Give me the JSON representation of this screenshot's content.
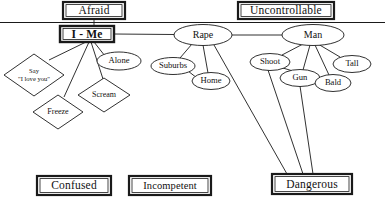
{
  "diagram": {
    "type": "concept-map",
    "background_color": "#ffffff",
    "line_color": "#1a1a1a",
    "text_color": "#111111",
    "divider": {
      "name": "horizontal-divider",
      "y": 22,
      "x1": 0,
      "x2": 385
    },
    "boxes": [
      {
        "id": "afraid",
        "label": "Afraid",
        "x": 63,
        "y": 2,
        "w": 62,
        "h": 17,
        "style": "double"
      },
      {
        "id": "uncontrollable",
        "label": "Uncontrollable",
        "x": 238,
        "y": 2,
        "w": 96,
        "h": 17,
        "style": "double"
      },
      {
        "id": "i-me",
        "label": "I - Me",
        "x": 60,
        "y": 26,
        "w": 54,
        "h": 16,
        "style": "double"
      },
      {
        "id": "confused",
        "label": "Confused",
        "x": 37,
        "y": 176,
        "w": 74,
        "h": 19,
        "style": "double"
      },
      {
        "id": "incompetent",
        "label": "Incompetent",
        "x": 129,
        "y": 176,
        "w": 82,
        "h": 19,
        "style": "double"
      },
      {
        "id": "dangerous",
        "label": "Dangerous",
        "x": 272,
        "y": 174,
        "w": 80,
        "h": 20,
        "style": "double"
      }
    ],
    "ellipses": [
      {
        "id": "rape",
        "label": "Rape",
        "cx": 203,
        "cy": 35,
        "rx": 29,
        "ry": 10.5,
        "size": "lg"
      },
      {
        "id": "man",
        "label": "Man",
        "cx": 313,
        "cy": 35,
        "rx": 31,
        "ry": 10.5,
        "size": "lg"
      },
      {
        "id": "alone",
        "label": "Alone",
        "cx": 119,
        "cy": 61,
        "rx": 22,
        "ry": 9,
        "size": "sm"
      },
      {
        "id": "suburbs",
        "label": "Suburbs",
        "cx": 173,
        "cy": 66,
        "rx": 22,
        "ry": 8.5,
        "size": "sm"
      },
      {
        "id": "home",
        "label": "Home",
        "cx": 211,
        "cy": 81,
        "rx": 19,
        "ry": 8.5,
        "size": "sm"
      },
      {
        "id": "shoot",
        "label": "Shoot",
        "cx": 270,
        "cy": 62,
        "rx": 20,
        "ry": 8.5,
        "size": "sm"
      },
      {
        "id": "gun",
        "label": "Gun",
        "cx": 300,
        "cy": 78,
        "rx": 20,
        "ry": 8.5,
        "size": "sm"
      },
      {
        "id": "tall",
        "label": "Tall",
        "cx": 352,
        "cy": 64,
        "rx": 19,
        "ry": 8.5,
        "size": "sm"
      },
      {
        "id": "bald",
        "label": "Bald",
        "cx": 333,
        "cy": 83,
        "rx": 18,
        "ry": 8.5,
        "size": "sm"
      }
    ],
    "diamonds": [
      {
        "id": "say-i-love-you",
        "label": "Say\n\"I love you\"",
        "cx": 34,
        "cy": 75,
        "rx": 30,
        "ry": 21,
        "size": "sm"
      },
      {
        "id": "scream",
        "label": "Scream",
        "cx": 104,
        "cy": 95,
        "rx": 26,
        "ry": 17,
        "size": "md"
      },
      {
        "id": "freeze",
        "label": "Freeze",
        "cx": 58,
        "cy": 112,
        "rx": 25,
        "ry": 17,
        "size": "md"
      }
    ],
    "edges": [
      {
        "from": "afraid",
        "to": "i-me",
        "name": "edge-afraid-i-me"
      },
      {
        "from": "i-me",
        "to": "rape",
        "name": "edge-i-me-rape"
      },
      {
        "from": "rape",
        "to": "man",
        "name": "edge-rape-man"
      },
      {
        "from": "i-me",
        "to": "say-i-love-you",
        "name": "edge-i-me-say"
      },
      {
        "from": "i-me",
        "to": "freeze",
        "name": "edge-i-me-freeze"
      },
      {
        "from": "i-me",
        "to": "scream",
        "name": "edge-i-me-scream"
      },
      {
        "from": "i-me",
        "to": "alone",
        "name": "edge-i-me-alone"
      },
      {
        "from": "rape",
        "to": "suburbs",
        "name": "edge-rape-suburbs"
      },
      {
        "from": "rape",
        "to": "home",
        "name": "edge-rape-home"
      },
      {
        "from": "suburbs",
        "to": "home",
        "name": "edge-suburbs-home"
      },
      {
        "from": "rape",
        "to": "dangerous",
        "name": "edge-rape-dangerous"
      },
      {
        "from": "man",
        "to": "shoot",
        "name": "edge-man-shoot"
      },
      {
        "from": "man",
        "to": "gun",
        "name": "edge-man-gun"
      },
      {
        "from": "man",
        "to": "tall",
        "name": "edge-man-tall"
      },
      {
        "from": "man",
        "to": "bald",
        "name": "edge-man-bald"
      },
      {
        "from": "shoot",
        "to": "gun",
        "name": "edge-shoot-gun"
      },
      {
        "from": "shoot",
        "to": "dangerous",
        "name": "edge-shoot-dangerous"
      },
      {
        "from": "gun",
        "to": "dangerous",
        "name": "edge-gun-dangerous"
      }
    ]
  }
}
